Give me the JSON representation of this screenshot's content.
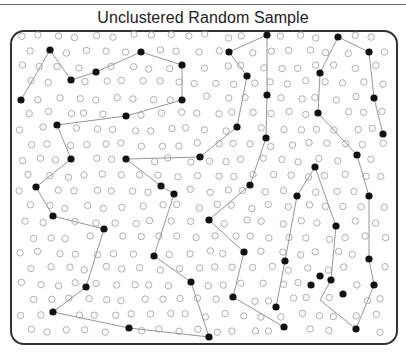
{
  "header": {
    "cropped_text": ""
  },
  "title": "Unclustered Random Sample",
  "colors": {
    "frame": "#333333",
    "empty_dot": "#9a9a9a",
    "filled_dot": "#111111",
    "line": "#8a8a8a"
  },
  "grid": {
    "x0": 22,
    "y0": 36,
    "dx": 18.5,
    "dy": 15.5,
    "cols": 20,
    "rows": 20,
    "jitter": 7,
    "r": 3.2
  },
  "filled_dots": [
    [
      21,
      100
    ],
    [
      50,
      50
    ],
    [
      71,
      80
    ],
    [
      96,
      72
    ],
    [
      141,
      52
    ],
    [
      182,
      65
    ],
    [
      182,
      100
    ],
    [
      126,
      116
    ],
    [
      57,
      125
    ],
    [
      71,
      159
    ],
    [
      36,
      187
    ],
    [
      53,
      216
    ],
    [
      104,
      229
    ],
    [
      86,
      287
    ],
    [
      53,
      312
    ],
    [
      129,
      328
    ],
    [
      209,
      337
    ],
    [
      126,
      159
    ],
    [
      200,
      157
    ],
    [
      237,
      127
    ],
    [
      247,
      76
    ],
    [
      229,
      52
    ],
    [
      267,
      35
    ],
    [
      267,
      95
    ],
    [
      266,
      138
    ],
    [
      161,
      186
    ],
    [
      174,
      194
    ],
    [
      154,
      256
    ],
    [
      191,
      282
    ],
    [
      250,
      185
    ],
    [
      209,
      220
    ],
    [
      244,
      252
    ],
    [
      233,
      297
    ],
    [
      284,
      327
    ],
    [
      338,
      37
    ],
    [
      369,
      52
    ],
    [
      374,
      98
    ],
    [
      383,
      134
    ],
    [
      320,
      73
    ],
    [
      318,
      113
    ],
    [
      357,
      155
    ],
    [
      369,
      196
    ],
    [
      369,
      259
    ],
    [
      374,
      285
    ],
    [
      343,
      294
    ],
    [
      356,
      329
    ],
    [
      315,
      167
    ],
    [
      297,
      196
    ],
    [
      285,
      261
    ],
    [
      276,
      307
    ],
    [
      336,
      226
    ],
    [
      331,
      280
    ],
    [
      320,
      276
    ],
    [
      311,
      285
    ]
  ],
  "paths": [
    [
      [
        21,
        100
      ],
      [
        50,
        50
      ],
      [
        71,
        80
      ],
      [
        96,
        72
      ],
      [
        141,
        52
      ],
      [
        182,
        65
      ],
      [
        182,
        100
      ],
      [
        126,
        116
      ],
      [
        57,
        125
      ],
      [
        71,
        159
      ],
      [
        36,
        187
      ],
      [
        53,
        216
      ],
      [
        104,
        229
      ],
      [
        86,
        287
      ],
      [
        53,
        312
      ],
      [
        129,
        328
      ],
      [
        209,
        337
      ]
    ],
    [
      [
        267,
        35
      ],
      [
        229,
        52
      ],
      [
        247,
        76
      ],
      [
        237,
        127
      ],
      [
        200,
        157
      ],
      [
        126,
        159
      ],
      [
        161,
        186
      ],
      [
        174,
        194
      ],
      [
        154,
        256
      ],
      [
        191,
        282
      ],
      [
        209,
        337
      ]
    ],
    [
      [
        267,
        35
      ],
      [
        267,
        95
      ],
      [
        266,
        138
      ],
      [
        250,
        185
      ],
      [
        209,
        220
      ],
      [
        244,
        252
      ],
      [
        233,
        297
      ],
      [
        284,
        327
      ]
    ],
    [
      [
        338,
        37
      ],
      [
        369,
        52
      ],
      [
        374,
        98
      ],
      [
        383,
        134
      ]
    ],
    [
      [
        338,
        37
      ],
      [
        320,
        73
      ],
      [
        318,
        113
      ],
      [
        357,
        155
      ],
      [
        369,
        196
      ],
      [
        369,
        259
      ],
      [
        374,
        285
      ],
      [
        356,
        329
      ],
      [
        320,
        300
      ],
      [
        331,
        280
      ]
    ],
    [
      [
        315,
        167
      ],
      [
        297,
        196
      ],
      [
        285,
        261
      ],
      [
        276,
        307
      ]
    ],
    [
      [
        315,
        167
      ],
      [
        336,
        226
      ],
      [
        331,
        280
      ]
    ]
  ]
}
